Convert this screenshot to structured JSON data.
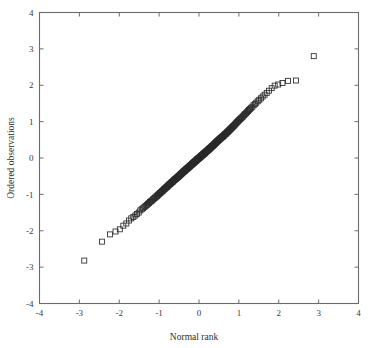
{
  "figure": {
    "background_color": "#ffffff",
    "frame_color": "#6b6b6b",
    "marker_color": "#2a2a2a",
    "marker_shape": "open-square",
    "marker_size_px": 5
  },
  "chart_data": {
    "type": "scatter",
    "title": "",
    "subtitle": "",
    "xlabel": "Normal rank",
    "ylabel": "Ordered observations",
    "xlim": [
      -4,
      4
    ],
    "ylim": [
      -4,
      4
    ],
    "xticks": [
      -4,
      -3,
      -2,
      -1,
      0,
      1,
      2,
      3,
      4
    ],
    "yticks": [
      -4,
      -3,
      -2,
      -1,
      0,
      1,
      2,
      3,
      4
    ],
    "xtick_labels": [
      "-4",
      "-3",
      "-2",
      "-1",
      "0",
      "1",
      "2",
      "3",
      "4"
    ],
    "ytick_labels": [
      "-4",
      "-3",
      "-2",
      "-1",
      "0",
      "1",
      "2",
      "3",
      "4"
    ],
    "grid": false,
    "legend": null,
    "legend_position": "none",
    "annotations": [],
    "series": [
      {
        "name": "Normal Q-Q",
        "marker": "open-square",
        "x": [
          -2.878,
          -2.431,
          -2.231,
          -2.093,
          -1.986,
          -1.898,
          -1.823,
          -1.757,
          -1.699,
          -1.646,
          -1.597,
          -1.553,
          -1.511,
          -1.473,
          -1.436,
          -1.402,
          -1.369,
          -1.338,
          -1.309,
          -1.281,
          -1.254,
          -1.228,
          -1.203,
          -1.179,
          -1.156,
          -1.133,
          -1.112,
          -1.091,
          -1.07,
          -1.05,
          -1.031,
          -1.012,
          -0.994,
          -0.976,
          -0.958,
          -0.941,
          -0.925,
          -0.908,
          -0.892,
          -0.877,
          -0.861,
          -0.846,
          -0.832,
          -0.817,
          -0.803,
          -0.789,
          -0.775,
          -0.762,
          -0.748,
          -0.735,
          -0.722,
          -0.71,
          -0.697,
          -0.685,
          -0.673,
          -0.661,
          -0.649,
          -0.638,
          -0.626,
          -0.615,
          -0.604,
          -0.593,
          -0.582,
          -0.571,
          -0.56,
          -0.55,
          -0.539,
          -0.529,
          -0.519,
          -0.509,
          -0.499,
          -0.489,
          -0.479,
          -0.469,
          -0.459,
          -0.45,
          -0.44,
          -0.431,
          -0.422,
          -0.412,
          -0.403,
          -0.394,
          -0.385,
          -0.376,
          -0.367,
          -0.358,
          -0.35,
          -0.341,
          -0.332,
          -0.324,
          -0.315,
          -0.307,
          -0.298,
          -0.29,
          -0.281,
          -0.273,
          -0.265,
          -0.257,
          -0.249,
          -0.24,
          -0.232,
          -0.224,
          -0.216,
          -0.208,
          -0.2,
          -0.193,
          -0.185,
          -0.177,
          -0.169,
          -0.161,
          -0.154,
          -0.146,
          -0.138,
          -0.131,
          -0.123,
          -0.115,
          -0.108,
          -0.1,
          -0.093,
          -0.085,
          -0.078,
          -0.07,
          -0.063,
          -0.055,
          -0.048,
          -0.04,
          -0.033,
          -0.026,
          -0.018,
          -0.011,
          -0.004,
          0.004,
          0.011,
          0.018,
          0.026,
          0.033,
          0.04,
          0.048,
          0.055,
          0.063,
          0.07,
          0.078,
          0.085,
          0.093,
          0.1,
          0.108,
          0.115,
          0.123,
          0.131,
          0.138,
          0.146,
          0.154,
          0.161,
          0.169,
          0.177,
          0.185,
          0.193,
          0.2,
          0.208,
          0.216,
          0.224,
          0.232,
          0.24,
          0.249,
          0.257,
          0.265,
          0.273,
          0.281,
          0.29,
          0.298,
          0.307,
          0.315,
          0.324,
          0.332,
          0.341,
          0.35,
          0.358,
          0.367,
          0.376,
          0.385,
          0.394,
          0.403,
          0.412,
          0.422,
          0.431,
          0.44,
          0.45,
          0.459,
          0.469,
          0.479,
          0.489,
          0.499,
          0.509,
          0.519,
          0.529,
          0.539,
          0.55,
          0.56,
          0.571,
          0.582,
          0.593,
          0.604,
          0.615,
          0.626,
          0.638,
          0.649,
          0.661,
          0.673,
          0.685,
          0.697,
          0.71,
          0.722,
          0.735,
          0.748,
          0.762,
          0.775,
          0.789,
          0.803,
          0.817,
          0.832,
          0.846,
          0.861,
          0.877,
          0.892,
          0.908,
          0.925,
          0.941,
          0.958,
          0.976,
          0.994,
          1.012,
          1.031,
          1.05,
          1.07,
          1.091,
          1.112,
          1.133,
          1.156,
          1.179,
          1.203,
          1.228,
          1.254,
          1.281,
          1.309,
          1.338,
          1.369,
          1.402,
          1.436,
          1.473,
          1.511,
          1.553,
          1.597,
          1.646,
          1.699,
          1.757,
          1.823,
          1.898,
          1.986,
          2.093,
          2.231,
          2.431,
          2.878
        ],
        "y": [
          -2.82,
          -2.3,
          -2.1,
          -2.02,
          -1.96,
          -1.86,
          -1.8,
          -1.72,
          -1.66,
          -1.62,
          -1.58,
          -1.54,
          -1.5,
          -1.44,
          -1.41,
          -1.38,
          -1.35,
          -1.32,
          -1.29,
          -1.26,
          -1.24,
          -1.21,
          -1.19,
          -1.17,
          -1.14,
          -1.12,
          -1.1,
          -1.08,
          -1.06,
          -1.04,
          -1.02,
          -1.0,
          -0.98,
          -0.96,
          -0.95,
          -0.93,
          -0.91,
          -0.9,
          -0.88,
          -0.86,
          -0.85,
          -0.83,
          -0.82,
          -0.8,
          -0.79,
          -0.78,
          -0.76,
          -0.75,
          -0.73,
          -0.72,
          -0.71,
          -0.7,
          -0.68,
          -0.67,
          -0.66,
          -0.65,
          -0.64,
          -0.62,
          -0.61,
          -0.6,
          -0.59,
          -0.58,
          -0.57,
          -0.56,
          -0.55,
          -0.54,
          -0.53,
          -0.52,
          -0.51,
          -0.5,
          -0.49,
          -0.48,
          -0.47,
          -0.46,
          -0.45,
          -0.44,
          -0.43,
          -0.42,
          -0.41,
          -0.4,
          -0.39,
          -0.38,
          -0.37,
          -0.37,
          -0.36,
          -0.35,
          -0.34,
          -0.33,
          -0.32,
          -0.31,
          -0.31,
          -0.3,
          -0.29,
          -0.28,
          -0.27,
          -0.27,
          -0.26,
          -0.25,
          -0.24,
          -0.23,
          -0.23,
          -0.22,
          -0.21,
          -0.2,
          -0.19,
          -0.19,
          -0.18,
          -0.17,
          -0.16,
          -0.16,
          -0.15,
          -0.14,
          -0.13,
          -0.13,
          -0.12,
          -0.11,
          -0.1,
          -0.1,
          -0.09,
          -0.08,
          -0.07,
          -0.07,
          -0.06,
          -0.05,
          -0.04,
          -0.04,
          -0.03,
          -0.02,
          -0.02,
          -0.01,
          0.0,
          0.0,
          0.01,
          0.02,
          0.02,
          0.03,
          0.04,
          0.05,
          0.05,
          0.06,
          0.07,
          0.08,
          0.08,
          0.09,
          0.1,
          0.1,
          0.11,
          0.12,
          0.13,
          0.13,
          0.14,
          0.15,
          0.16,
          0.16,
          0.17,
          0.18,
          0.19,
          0.19,
          0.2,
          0.21,
          0.22,
          0.23,
          0.23,
          0.24,
          0.25,
          0.26,
          0.27,
          0.27,
          0.28,
          0.29,
          0.3,
          0.31,
          0.32,
          0.33,
          0.33,
          0.34,
          0.35,
          0.36,
          0.37,
          0.38,
          0.39,
          0.4,
          0.41,
          0.42,
          0.43,
          0.44,
          0.45,
          0.46,
          0.47,
          0.48,
          0.49,
          0.5,
          0.51,
          0.52,
          0.53,
          0.54,
          0.55,
          0.56,
          0.57,
          0.58,
          0.59,
          0.6,
          0.61,
          0.62,
          0.64,
          0.65,
          0.66,
          0.67,
          0.68,
          0.7,
          0.71,
          0.72,
          0.74,
          0.75,
          0.77,
          0.78,
          0.8,
          0.81,
          0.83,
          0.84,
          0.86,
          0.88,
          0.89,
          0.91,
          0.93,
          0.95,
          0.97,
          0.99,
          1.01,
          1.03,
          1.05,
          1.07,
          1.09,
          1.11,
          1.13,
          1.16,
          1.18,
          1.21,
          1.23,
          1.26,
          1.29,
          1.32,
          1.35,
          1.38,
          1.41,
          1.45,
          1.48,
          1.52,
          1.56,
          1.6,
          1.64,
          1.69,
          1.74,
          1.79,
          1.85,
          1.92,
          1.99,
          2.02,
          2.06,
          2.12,
          2.13,
          2.8
        ]
      }
    ]
  }
}
